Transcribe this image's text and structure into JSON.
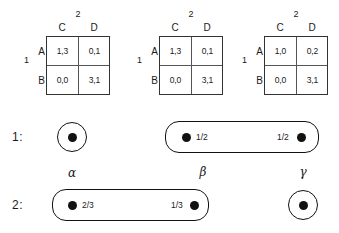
{
  "figure": {
    "type": "game-theory-diagram",
    "row_player": "1",
    "col_player": "2"
  },
  "matrices": [
    {
      "id": "matrix-1",
      "col_player": "2",
      "row_player": "1",
      "col_headers": [
        "C",
        "D"
      ],
      "row_headers": [
        "A",
        "B"
      ],
      "cells": [
        [
          "1,3",
          "0,1"
        ],
        [
          "0,0",
          "3,1"
        ]
      ]
    },
    {
      "id": "matrix-2",
      "col_player": "2",
      "row_player": "1",
      "col_headers": [
        "C",
        "D"
      ],
      "row_headers": [
        "A",
        "B"
      ],
      "cells": [
        [
          "1,3",
          "0,1"
        ],
        [
          "0,0",
          "3,1"
        ]
      ]
    },
    {
      "id": "matrix-3",
      "col_player": "2",
      "row_player": "1",
      "col_headers": [
        "C",
        "D"
      ],
      "row_headers": [
        "A",
        "B"
      ],
      "cells": [
        [
          "1,0",
          "0,2"
        ],
        [
          "0,0",
          "3,1"
        ]
      ]
    }
  ],
  "player1_row": {
    "label": "1:",
    "singleton_node": {
      "kind": "circled-node"
    },
    "infoset": {
      "left_prob": "1/2",
      "right_prob": "1/2"
    }
  },
  "player2_row": {
    "label": "2:",
    "infoset": {
      "left_prob": "2/3",
      "right_prob": "1/3",
      "left_name": "α",
      "right_name": "β"
    },
    "singleton_node": {
      "name": "γ",
      "kind": "circled-node"
    }
  },
  "colors": {
    "line": "#333333",
    "inner_line": "#555555",
    "node": "#111111",
    "text": "#1a1a1a",
    "background": "#ffffff"
  }
}
